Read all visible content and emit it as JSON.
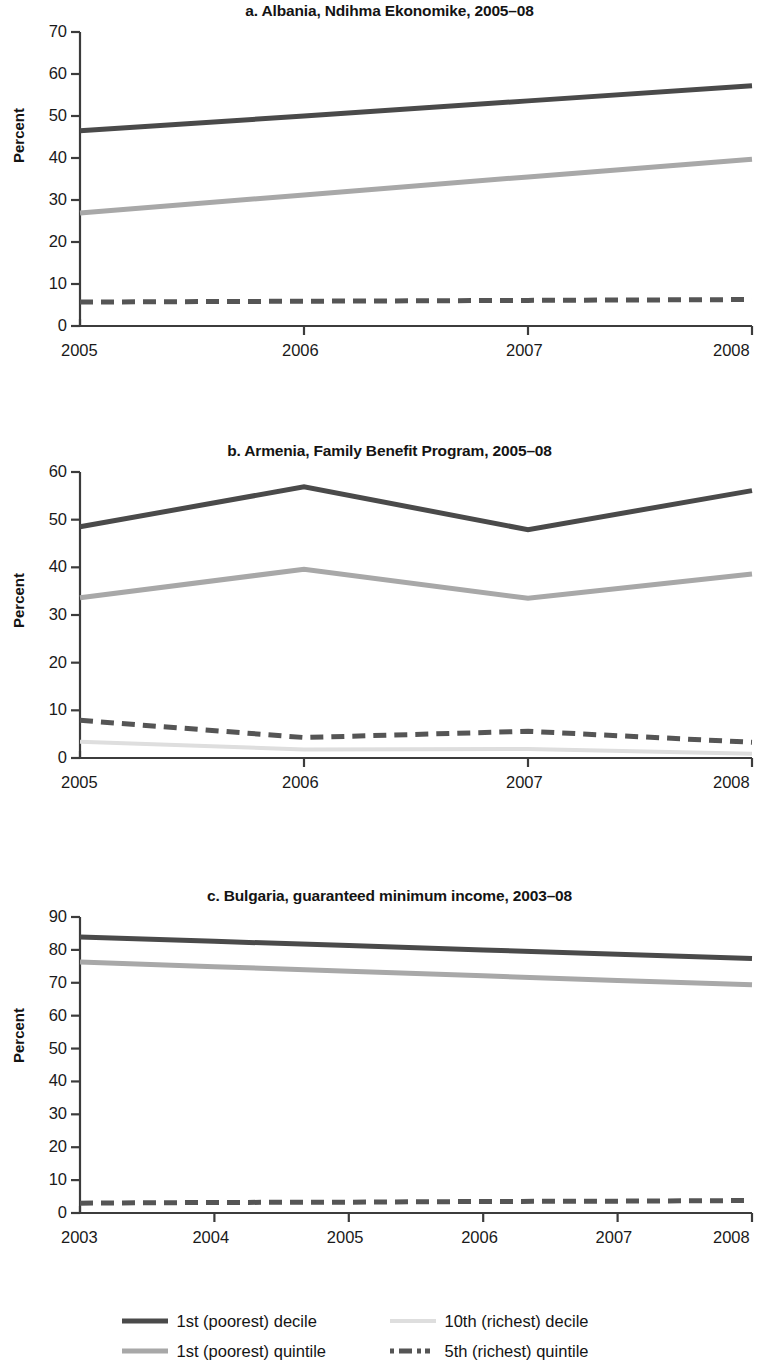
{
  "figure": {
    "ylabel": "Percent",
    "colors": {
      "decile1": "#4a4a4a",
      "quintile1": "#a8a8a8",
      "decile10": "#dedede",
      "quintile5": "#555555",
      "axis": "#3c3c3c",
      "text": "#1a1a1a"
    }
  },
  "legend": {
    "items": [
      {
        "label": "1st (poorest) decile",
        "key": "decile1",
        "style": "solid",
        "color": "#4a4a4a",
        "width": 5
      },
      {
        "label": "10th (richest) decile",
        "key": "decile10",
        "style": "solid",
        "color": "#dedede",
        "width": 4
      },
      {
        "label": "1st (poorest) quintile",
        "key": "quintile1",
        "style": "solid",
        "color": "#a8a8a8",
        "width": 5
      },
      {
        "label": "5th (richest) quintile",
        "key": "quintile5",
        "style": "dashed",
        "color": "#555555",
        "width": 5
      }
    ]
  },
  "chart_data": [
    {
      "id": "a",
      "type": "line",
      "title": "a. Albania, Ndihma Ekonomike, 2005–08",
      "xlabel": "",
      "ylabel": "Percent",
      "x": [
        2005,
        2006,
        2007,
        2008
      ],
      "xticklabels": [
        "2005",
        "2006",
        "2007",
        "2008"
      ],
      "yticks": [
        0,
        10,
        20,
        30,
        40,
        50,
        60,
        70
      ],
      "yticklabels": [
        "0",
        "10",
        "20",
        "30",
        "40",
        "50",
        "60",
        "70"
      ],
      "ylim": [
        0,
        70
      ],
      "xlim": [
        2005,
        2008
      ],
      "grid": false,
      "series": [
        {
          "name": "1st (poorest) decile",
          "key": "decile1",
          "values": [
            46.5,
            50.0,
            53.6,
            57.2
          ]
        },
        {
          "name": "1st (poorest) quintile",
          "key": "quintile1",
          "values": [
            26.9,
            31.2,
            35.5,
            39.7
          ]
        },
        {
          "name": "5th (richest) quintile",
          "key": "quintile5",
          "values": [
            5.7,
            5.9,
            6.1,
            6.3
          ]
        }
      ]
    },
    {
      "id": "b",
      "type": "line",
      "title": "b. Armenia, Family Benefit Program, 2005–08",
      "xlabel": "",
      "ylabel": "Percent",
      "x": [
        2005,
        2006,
        2007,
        2008
      ],
      "xticklabels": [
        "2005",
        "2006",
        "2007",
        "2008"
      ],
      "yticks": [
        0,
        10,
        20,
        30,
        40,
        50,
        60
      ],
      "yticklabels": [
        "0",
        "10",
        "20",
        "30",
        "40",
        "50",
        "60"
      ],
      "ylim": [
        0,
        60
      ],
      "xlim": [
        2005,
        2008
      ],
      "grid": false,
      "series": [
        {
          "name": "1st (poorest) decile",
          "key": "decile1",
          "values": [
            48.5,
            56.9,
            47.9,
            56.1
          ]
        },
        {
          "name": "1st (poorest) quintile",
          "key": "quintile1",
          "values": [
            33.6,
            39.6,
            33.5,
            38.6
          ]
        },
        {
          "name": "5th (richest) quintile",
          "key": "quintile5",
          "values": [
            7.9,
            4.3,
            5.6,
            3.3
          ]
        },
        {
          "name": "10th (richest) decile",
          "key": "decile10",
          "values": [
            3.4,
            1.8,
            1.9,
            0.9
          ]
        }
      ]
    },
    {
      "id": "c",
      "type": "line",
      "title": "c. Bulgaria, guaranteed minimum income, 2003–08",
      "xlabel": "",
      "ylabel": "Percent",
      "x": [
        2003,
        2004,
        2005,
        2006,
        2007,
        2008
      ],
      "xticklabels": [
        "2003",
        "2004",
        "2005",
        "2006",
        "2007",
        "2008"
      ],
      "yticks": [
        0,
        10,
        20,
        30,
        40,
        50,
        60,
        70,
        80,
        90
      ],
      "yticklabels": [
        "0",
        "10",
        "20",
        "30",
        "40",
        "50",
        "60",
        "70",
        "80",
        "90"
      ],
      "ylim": [
        0,
        90
      ],
      "xlim": [
        2003,
        2008
      ],
      "grid": false,
      "series": [
        {
          "name": "1st (poorest) decile",
          "key": "decile1",
          "values": [
            83.9,
            82.6,
            81.3,
            80.0,
            78.7,
            77.4
          ]
        },
        {
          "name": "1st (poorest) quintile",
          "key": "quintile1",
          "values": [
            76.3,
            74.9,
            73.5,
            72.1,
            70.7,
            69.4
          ]
        },
        {
          "name": "5th (richest) quintile",
          "key": "quintile5",
          "values": [
            3.0,
            3.2,
            3.3,
            3.5,
            3.6,
            3.8
          ]
        }
      ]
    }
  ]
}
